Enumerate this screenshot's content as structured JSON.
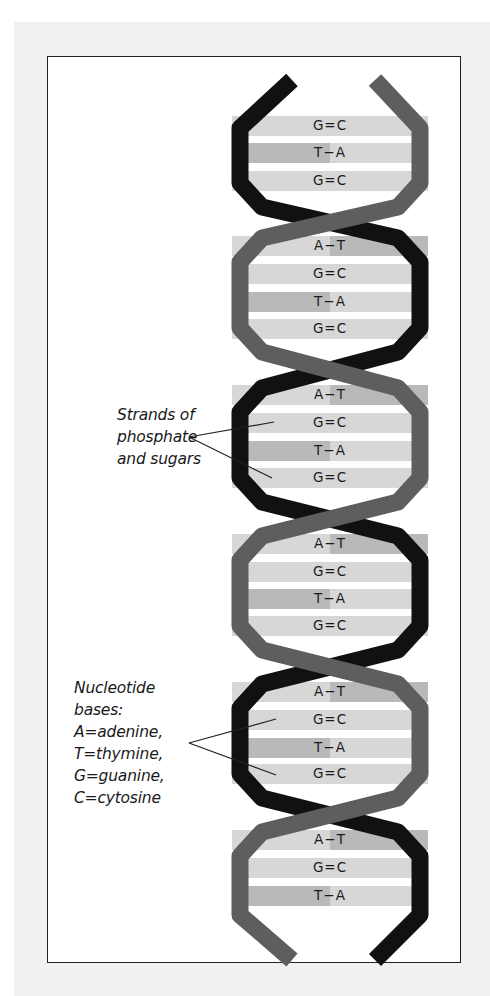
{
  "figure": {
    "strand_colors": {
      "strand_a": "#111111",
      "strand_b": "#5e5e5e"
    },
    "bar_colors": {
      "light": "#d7d7d7",
      "mid": "#b9b9b9"
    },
    "annotations": {
      "strands": {
        "lines": [
          "Strands of",
          "phosphate",
          "and sugars"
        ]
      },
      "bases": {
        "lines": [
          "Nucleotide",
          "bases:",
          "A=adenine,",
          "T=thymine,",
          "G=guanine,",
          "C=cytosine"
        ]
      }
    },
    "base_pairs": [
      {
        "label": "G=C",
        "y": 126
      },
      {
        "label": "T−A",
        "y": 153
      },
      {
        "label": "G=C",
        "y": 181
      },
      {
        "label": "A−T",
        "y": 246
      },
      {
        "label": "G=C",
        "y": 274
      },
      {
        "label": "T−A",
        "y": 302
      },
      {
        "label": "G=C",
        "y": 329
      },
      {
        "label": "A−T",
        "y": 395
      },
      {
        "label": "G=C",
        "y": 423
      },
      {
        "label": "T−A",
        "y": 451
      },
      {
        "label": "G=C",
        "y": 478
      },
      {
        "label": "A−T",
        "y": 544
      },
      {
        "label": "G=C",
        "y": 572
      },
      {
        "label": "T−A",
        "y": 599
      },
      {
        "label": "G=C",
        "y": 626
      },
      {
        "label": "A−T",
        "y": 692
      },
      {
        "label": "G=C",
        "y": 720
      },
      {
        "label": "T−A",
        "y": 748
      },
      {
        "label": "G=C",
        "y": 774
      },
      {
        "label": "A−T",
        "y": 840
      },
      {
        "label": "G=C",
        "y": 868
      },
      {
        "label": "T−A",
        "y": 896
      }
    ]
  }
}
